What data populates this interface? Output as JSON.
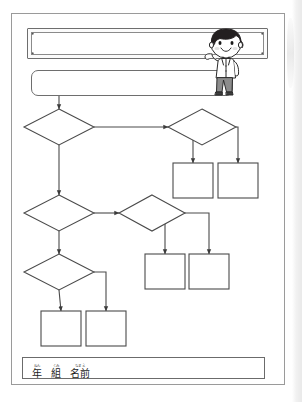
{
  "page": {
    "kind": "worksheet",
    "orientation": "portrait",
    "background_color": "#ffffff",
    "border_color": "#9a9a9a"
  },
  "header": {
    "title_plate": {
      "name": "title-plate",
      "value": "",
      "placeholder": "",
      "corner_dots": 4,
      "border_color": "#6e6e6e"
    },
    "subtitle_box": {
      "name": "subtitle-box",
      "value": "",
      "placeholder": "",
      "border_color": "#6e6e6e"
    },
    "illustration": {
      "icon": "boy-character-icon",
      "description": "smiling boy with black bowl-cut hair",
      "hair_color": "#231f20",
      "shirt_color": "#ffffff",
      "pants_color": "#8c8c8c"
    }
  },
  "flowchart": {
    "type": "flowchart",
    "stroke_color": "#4a4a4a",
    "fill_color": "#ffffff",
    "nodes": [
      {
        "id": "d1",
        "shape": "diamond",
        "label": "",
        "cx": 59,
        "cy": 127,
        "w": 70,
        "h": 36
      },
      {
        "id": "d2",
        "shape": "diamond",
        "label": "",
        "cx": 202,
        "cy": 127,
        "w": 68,
        "h": 36
      },
      {
        "id": "b1",
        "shape": "rect",
        "label": "",
        "x": 173,
        "y": 163,
        "w": 40,
        "h": 35
      },
      {
        "id": "b2",
        "shape": "rect",
        "label": "",
        "x": 218,
        "y": 163,
        "w": 40,
        "h": 35
      },
      {
        "id": "d3",
        "shape": "diamond",
        "label": "",
        "cx": 59,
        "cy": 213,
        "w": 70,
        "h": 36
      },
      {
        "id": "d4",
        "shape": "diamond",
        "label": "",
        "cx": 152,
        "cy": 213,
        "w": 66,
        "h": 36
      },
      {
        "id": "b3",
        "shape": "rect",
        "label": "",
        "x": 145,
        "y": 254,
        "w": 40,
        "h": 35
      },
      {
        "id": "b4",
        "shape": "rect",
        "label": "",
        "x": 189,
        "y": 254,
        "w": 40,
        "h": 35
      },
      {
        "id": "d5",
        "shape": "diamond",
        "label": "",
        "cx": 59,
        "cy": 272,
        "w": 70,
        "h": 36
      },
      {
        "id": "b5",
        "shape": "rect",
        "label": "",
        "x": 41,
        "y": 311,
        "w": 40,
        "h": 35
      },
      {
        "id": "b6",
        "shape": "rect",
        "label": "",
        "x": 86,
        "y": 311,
        "w": 40,
        "h": 35
      }
    ],
    "edges": [
      {
        "from": "subtitle_box",
        "to": "d1",
        "label": ""
      },
      {
        "from": "d1",
        "to": "d2",
        "label": ""
      },
      {
        "from": "d1",
        "to": "d3",
        "label": ""
      },
      {
        "from": "d2",
        "to": "b1",
        "label": ""
      },
      {
        "from": "d2",
        "to": "b2",
        "label": ""
      },
      {
        "from": "d3",
        "to": "d4",
        "label": ""
      },
      {
        "from": "d3",
        "to": "d5",
        "label": ""
      },
      {
        "from": "d4",
        "to": "b3",
        "label": ""
      },
      {
        "from": "d4",
        "to": "b4",
        "label": ""
      },
      {
        "from": "d5",
        "to": "b5",
        "label": ""
      },
      {
        "from": "d5",
        "to": "b6",
        "label": ""
      }
    ]
  },
  "footer": {
    "fields": [
      {
        "ruby": "ねん",
        "kanji": "年",
        "name": "year-field",
        "value": ""
      },
      {
        "ruby": "くみ",
        "kanji": "組",
        "name": "class-field",
        "value": ""
      },
      {
        "ruby": "なまえ",
        "kanji": "名前",
        "name": "name-field",
        "value": ""
      }
    ],
    "write_value": "",
    "write_placeholder": ""
  }
}
